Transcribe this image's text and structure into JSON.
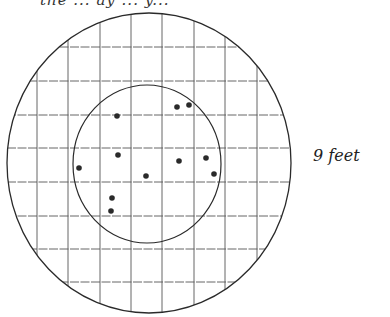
{
  "figure": {
    "top_caption_cut": "the ... ay ... y...",
    "side_label": "9 feet",
    "colors": {
      "ink": "#2a2a2a",
      "grid": "#555555",
      "paper": "#ffffff"
    }
  },
  "outer_circle": {
    "cx": 149,
    "cy": 163,
    "rx": 142,
    "ry": 150
  },
  "inner_circle": {
    "cx": 147,
    "cy": 164,
    "rx": 74,
    "ry": 79
  },
  "grid": {
    "vertical_x": [
      37,
      68,
      100,
      131,
      162,
      194,
      225,
      257
    ],
    "horizontal_y": [
      47,
      81,
      115,
      148,
      182,
      216,
      249,
      282
    ]
  },
  "dots": [
    {
      "x": 117,
      "y": 116
    },
    {
      "x": 177,
      "y": 107
    },
    {
      "x": 189,
      "y": 105
    },
    {
      "x": 118,
      "y": 155
    },
    {
      "x": 79,
      "y": 168
    },
    {
      "x": 146,
      "y": 176
    },
    {
      "x": 179,
      "y": 161
    },
    {
      "x": 206,
      "y": 158
    },
    {
      "x": 214,
      "y": 174
    },
    {
      "x": 112,
      "y": 198
    },
    {
      "x": 111,
      "y": 211
    }
  ]
}
